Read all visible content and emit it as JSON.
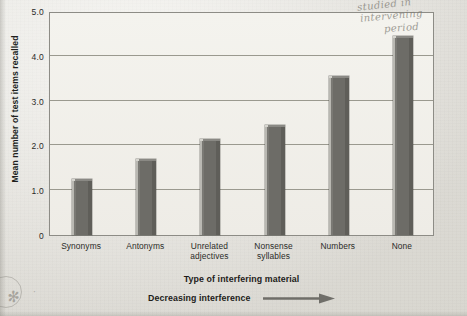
{
  "chart_data": {
    "type": "bar",
    "title": "",
    "categories": [
      "Synonyms",
      "Antonyms",
      "Unrelated adjectives",
      "Nonsense syllables",
      "Numbers",
      "None"
    ],
    "category_lines": [
      [
        "Synonyms"
      ],
      [
        "Antonyms"
      ],
      [
        "Unrelated",
        "adjectives"
      ],
      [
        "Nonsense",
        "syllables"
      ],
      [
        "Numbers"
      ],
      [
        "None"
      ]
    ],
    "values": [
      1.25,
      1.7,
      2.15,
      2.45,
      3.55,
      4.45
    ],
    "xlabel": "Type of interfering material",
    "ylabel": "Mean number of test items recalled",
    "ylim": [
      0,
      5.0
    ],
    "yticks": [
      "0",
      "1.0",
      "2.0",
      "3.0",
      "4.0",
      "5.0"
    ],
    "ytick_values": [
      0,
      1.0,
      2.0,
      3.0,
      4.0,
      5.0
    ],
    "grid": true,
    "legend": "none",
    "bar_color": "#6d6c67",
    "annotations": [
      {
        "text": "Decreasing interference",
        "has_arrow": true,
        "position": "below-xlabel"
      }
    ]
  },
  "axis_caption": {
    "interference_label": "Decreasing interference",
    "arrow_icon": "right-arrow-icon"
  },
  "handwriting": {
    "line1": "studied in",
    "line2": "intervening",
    "line3": "period",
    "star_mark": "✻",
    "dot_mark": "·"
  },
  "colors": {
    "bar": "#6d6c67",
    "bar_highlight": "#b9b8b2",
    "grid": "#9a998f",
    "frame": "#8d8c86",
    "paper": "#efeee8",
    "text": "#2b2b28",
    "handwriting": "#7d7a72"
  }
}
